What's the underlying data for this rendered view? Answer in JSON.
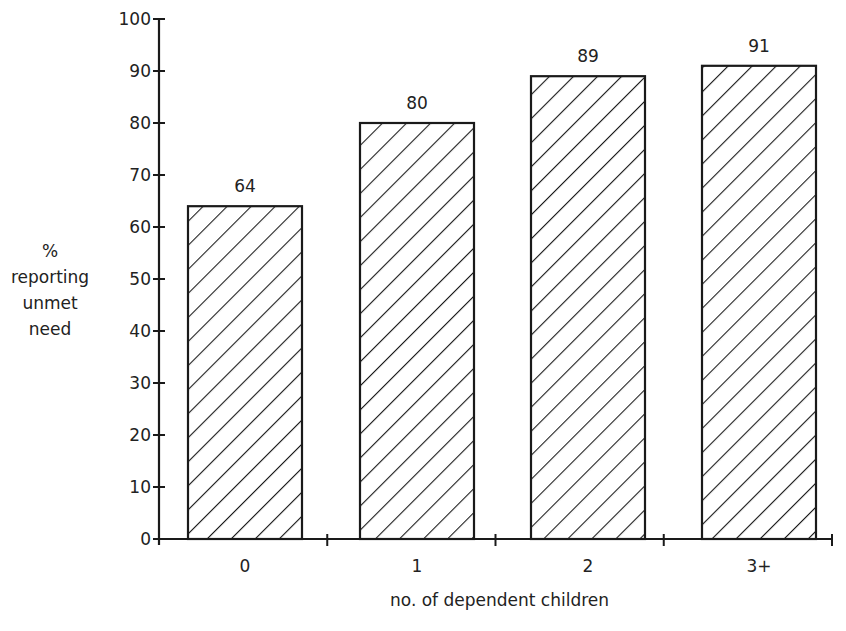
{
  "chart_data": {
    "type": "bar",
    "title": "",
    "xlabel": "no. of dependent children",
    "ylabel_lines": [
      "%",
      "reporting",
      "unmet",
      "need"
    ],
    "ylabel": "% reporting unmet need",
    "categories": [
      "0",
      "1",
      "2",
      "3+"
    ],
    "values": [
      64,
      80,
      89,
      91
    ],
    "data_labels": [
      "64",
      "80",
      "89",
      "91"
    ],
    "ylim": [
      0,
      100
    ],
    "yticks": [
      0,
      10,
      20,
      30,
      40,
      50,
      60,
      70,
      80,
      90,
      100
    ],
    "grid": false,
    "legend": null,
    "bar_fill": "diagonal-hatch",
    "colors": {
      "stroke": "#1a1a1a",
      "background": "#ffffff"
    }
  }
}
